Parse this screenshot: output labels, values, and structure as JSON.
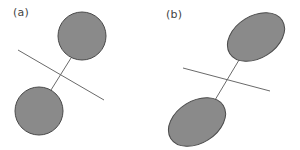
{
  "figure": {
    "colors": {
      "shape_fill": "#8a8a8a",
      "shape_stroke": "#4a4a4a",
      "line_stroke": "#6a6a6a",
      "background": "#ffffff"
    },
    "panels": [
      {
        "label": "(a)",
        "description": "Two circles connected by a line segment, crossed by a bisecting line",
        "shape": "circle"
      },
      {
        "label": "(b)",
        "description": "Two ellipses connected by a line segment, crossed by a bisecting line",
        "shape": "ellipse"
      }
    ]
  }
}
